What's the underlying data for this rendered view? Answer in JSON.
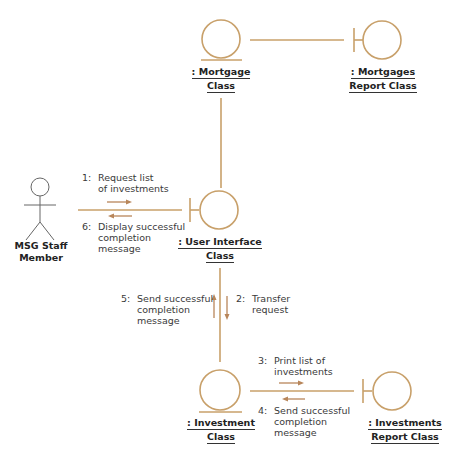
{
  "diagram": {
    "type": "UML collaboration diagram",
    "colors": {
      "line": "#c8a06a",
      "arrow": "#b8865a",
      "text": "#3a3a3a"
    },
    "actor": {
      "name_line1": "MSG Staff",
      "name_line2": "Member",
      "icon": "actor-stick-figure-icon"
    },
    "objects": {
      "mortgage_class": {
        "line1": ": Mortgage",
        "line2": "Class",
        "kind": "entity"
      },
      "mortgages_report_class": {
        "line1": ": Mortgages",
        "line2": "Report Class",
        "kind": "boundary"
      },
      "user_interface_class": {
        "line1": ": User Interface",
        "line2": "Class",
        "kind": "boundary"
      },
      "investment_class": {
        "line1": ": Investment",
        "line2": "Class",
        "kind": "entity"
      },
      "investments_report_class": {
        "line1": ": Investments",
        "line2": "Report Class",
        "kind": "boundary"
      }
    },
    "messages": [
      {
        "num": "1:",
        "line1": "Request list",
        "line2": "of investments",
        "line3": ""
      },
      {
        "num": "2:",
        "line1": "Transfer",
        "line2": "request",
        "line3": ""
      },
      {
        "num": "3:",
        "line1": "Print list of",
        "line2": "investments",
        "line3": ""
      },
      {
        "num": "4:",
        "line1": "Send successful",
        "line2": "completion",
        "line3": "message"
      },
      {
        "num": "5:",
        "line1": "Send successful",
        "line2": "completion",
        "line3": "message"
      },
      {
        "num": "6:",
        "line1": "Display successful",
        "line2": "completion",
        "line3": "message"
      }
    ]
  }
}
